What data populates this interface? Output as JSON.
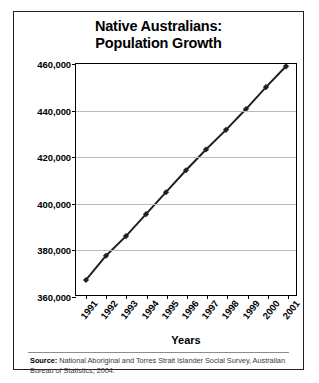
{
  "chart_data": {
    "type": "line",
    "title": "Native Australians: Population Growth",
    "title_lines": [
      "Native Australians:",
      "Population Growth"
    ],
    "xlabel": "Years",
    "ylabel": "",
    "categories": [
      "1991",
      "1992",
      "1993",
      "1994",
      "1995",
      "1996",
      "1997",
      "1998",
      "1999",
      "2000",
      "2001"
    ],
    "values": [
      366500,
      377000,
      385500,
      395000,
      404500,
      414000,
      423000,
      431500,
      440500,
      450000,
      459000
    ],
    "ylim": [
      360000,
      460000
    ],
    "ytick_values": [
      360000,
      380000,
      400000,
      420000,
      440000,
      460000
    ],
    "ytick_labels": [
      "360,000",
      "380,000",
      "400,000",
      "420,000",
      "440,000",
      "460,000"
    ],
    "grid": true,
    "legend": false,
    "marker": "diamond",
    "line_color": "#231f20",
    "marker_color": "#231f20",
    "grid_color": "#b9b9b9",
    "axis_color": "#000000"
  },
  "source": {
    "label": "Source:",
    "text": " National Aboriginal and Torres Strait Islander Social Survey, Australian Bureau of Statistics, 2004."
  }
}
